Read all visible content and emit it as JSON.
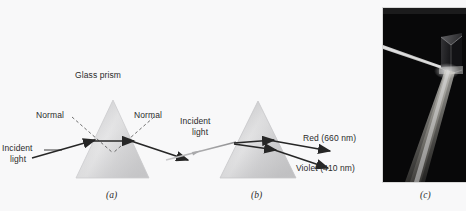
{
  "figure": {
    "background_color": "#f8f8f9",
    "panels": [
      {
        "id": "a",
        "caption": "(a)",
        "title_label": "Glass prism",
        "normal_left_label": "Normal",
        "normal_right_label": "Normal",
        "incident_line1": "Incident",
        "incident_line2": "light",
        "prism_fill_light": "#e9e9ea",
        "prism_fill_dark": "#c2c2c4",
        "ray_color": "#262626"
      },
      {
        "id": "b",
        "caption": "(b)",
        "incident_line1": "Incident",
        "incident_line2": "light",
        "red_label": "Red (660 nm)",
        "violet_label": "Violet (410 nm)",
        "prism_fill_light": "#e9e9ea",
        "prism_fill_dark": "#bfbfc1",
        "ray_color": "#262626"
      },
      {
        "id": "c",
        "caption": "(c)",
        "photo_description": "photograph-of-prism-dispersing-beam",
        "photo_background": "#080808",
        "beam_color": "#f2f2ee"
      }
    ]
  }
}
